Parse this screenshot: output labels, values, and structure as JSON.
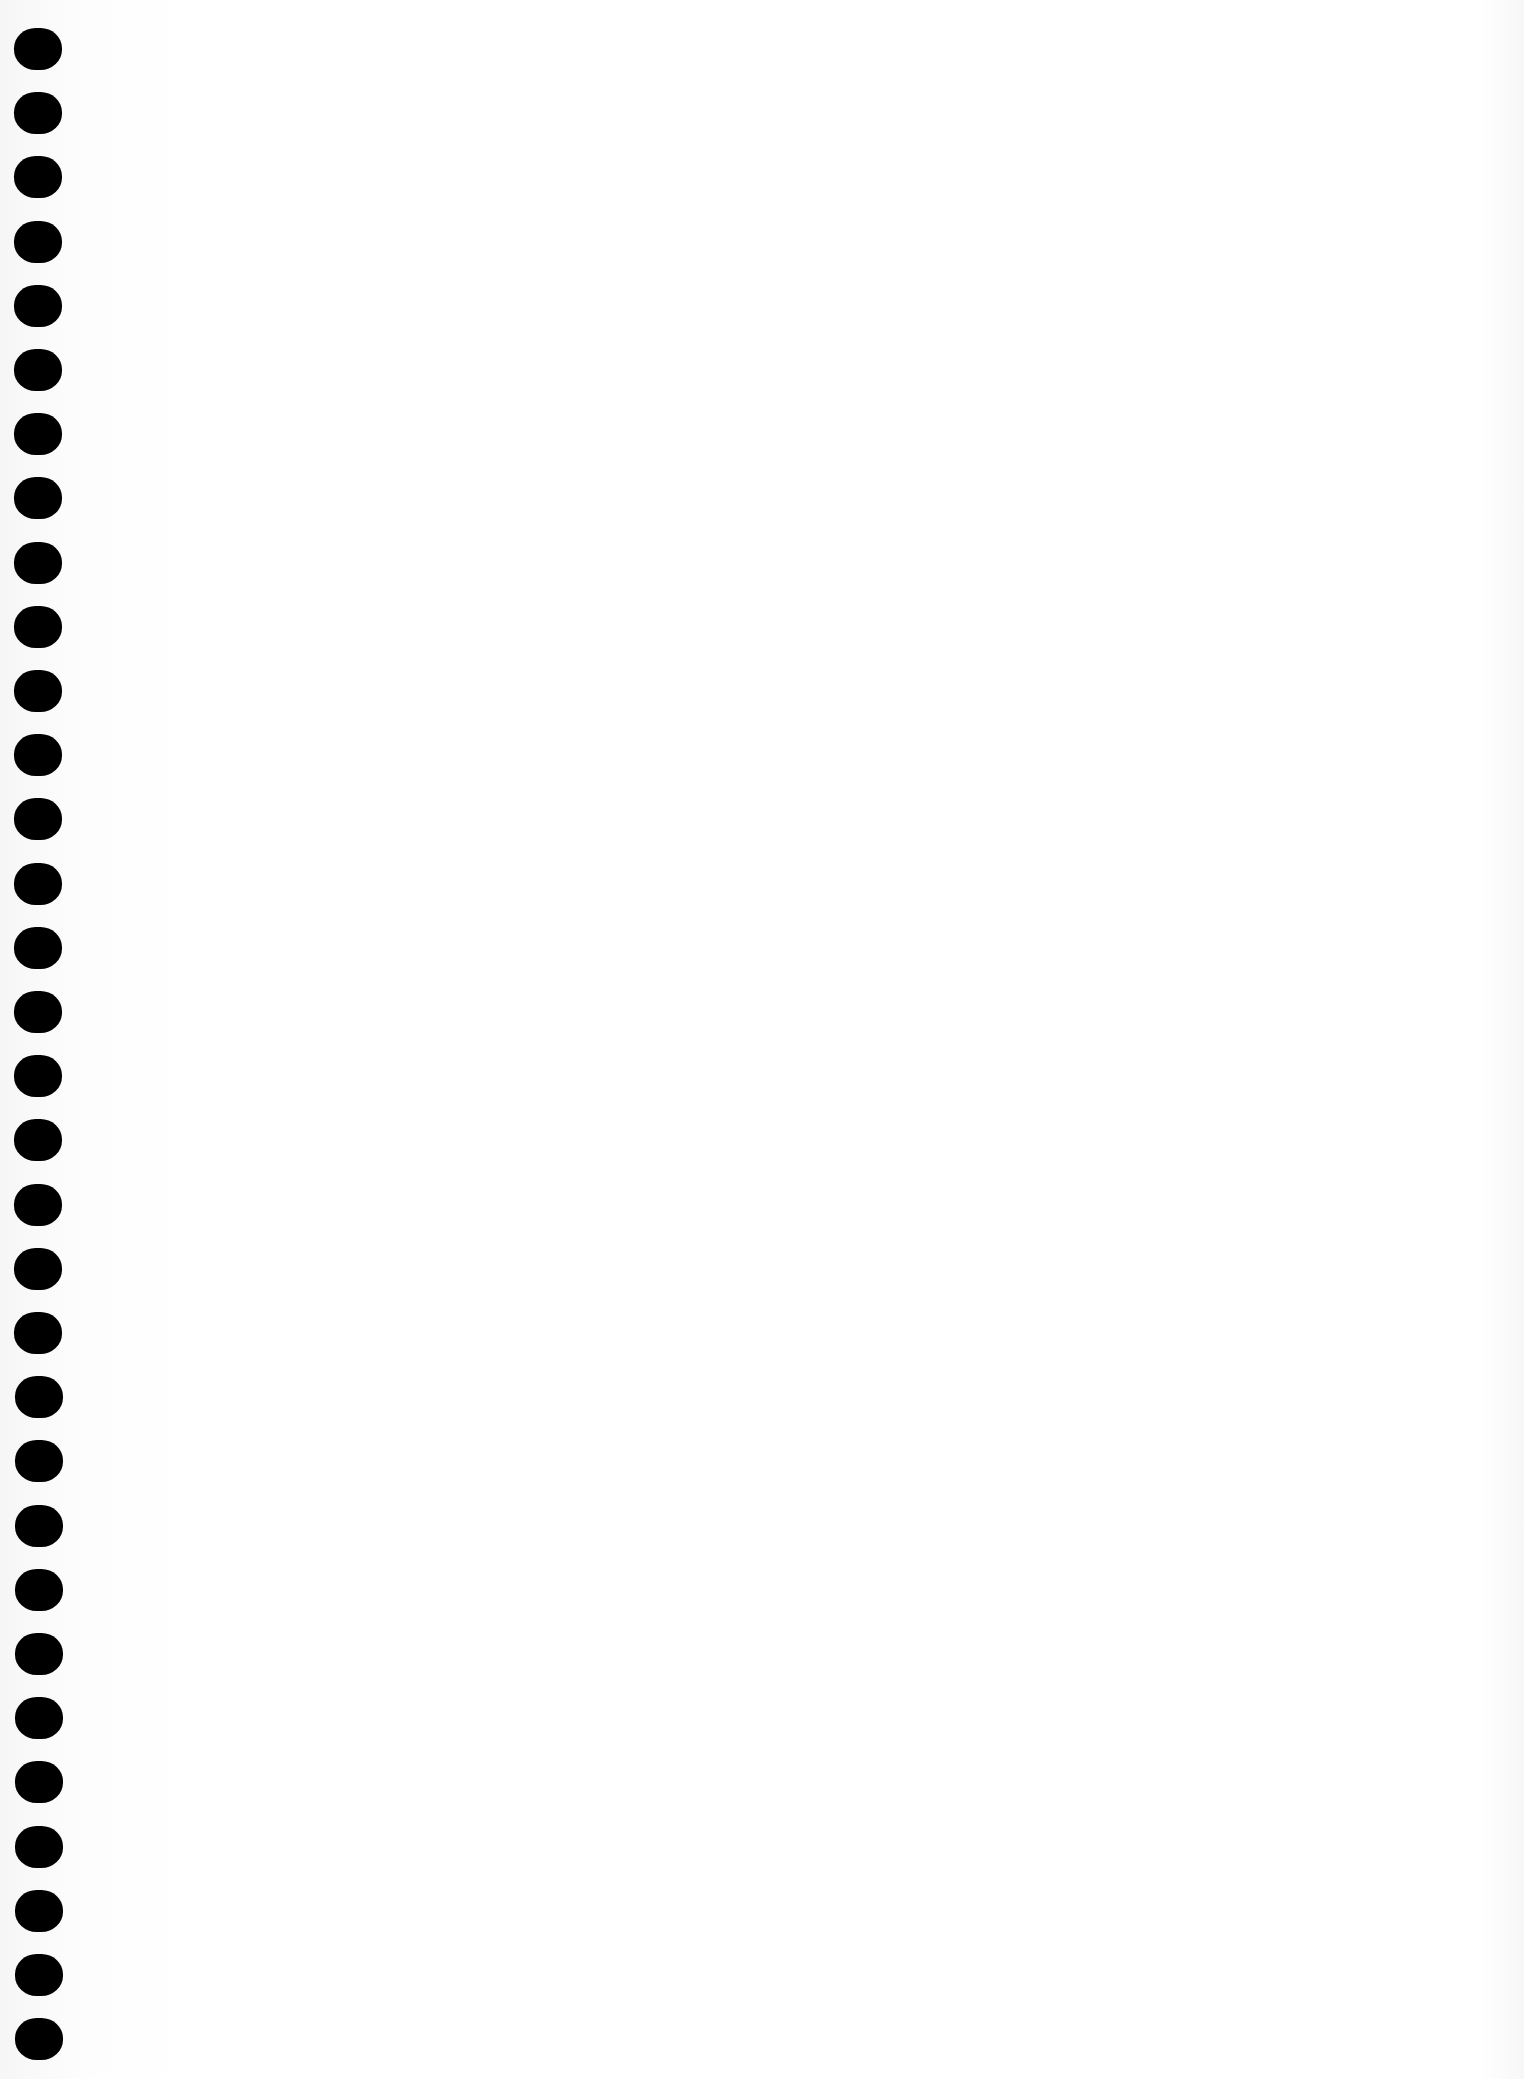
{
  "page": {
    "type": "blank-spiral-notebook-page",
    "background_color": "#ffffff",
    "hole_color": "#000000"
  },
  "binding": {
    "hole_count": 32,
    "first_hole_top": 28,
    "hole_spacing": 64.2,
    "hole_left": 14,
    "hole_width": 48,
    "hole_height": 42
  }
}
